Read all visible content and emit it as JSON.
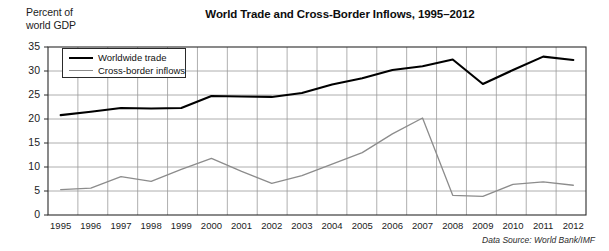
{
  "figure": {
    "title": "World Trade and Cross-Border Inflows, 1995–2012",
    "y_axis_caption": "Percent of\nworld GDP",
    "source_note": "Data Source: World Bank/IMF"
  },
  "legend": {
    "position": "top-left-inside",
    "entries": [
      {
        "label": "Worldwide trade",
        "color": "#000000",
        "style": "solid-thick"
      },
      {
        "label": "Cross-border inflows",
        "color": "#8c8c8c",
        "style": "solid-thin"
      }
    ]
  },
  "chart_data": {
    "type": "line",
    "title": "World Trade and Cross-Border Inflows, 1995–2012",
    "xlabel": "",
    "ylabel": "Percent of world GDP",
    "ylim": [
      0,
      35
    ],
    "yticks": [
      0,
      5,
      10,
      15,
      20,
      25,
      30,
      35
    ],
    "grid": true,
    "legend_position": "upper left",
    "categories": [
      "1995",
      "1996",
      "1997",
      "1998",
      "1999",
      "2000",
      "2001",
      "2002",
      "2003",
      "2004",
      "2005",
      "2006",
      "2007",
      "2008",
      "2009",
      "2010",
      "2011",
      "2012"
    ],
    "x": [
      1995,
      1996,
      1997,
      1998,
      1999,
      2000,
      2001,
      2002,
      2003,
      2004,
      2005,
      2006,
      2007,
      2008,
      2009,
      2010,
      2011,
      2012
    ],
    "series": [
      {
        "name": "Worldwide trade",
        "color": "#000000",
        "values": [
          20.8,
          21.5,
          22.3,
          22.2,
          22.3,
          24.8,
          24.7,
          24.6,
          25.4,
          27.2,
          28.5,
          30.2,
          31.0,
          32.4,
          27.3,
          30.2,
          33.0,
          32.3
        ]
      },
      {
        "name": "Cross-border inflows",
        "color": "#8c8c8c",
        "values": [
          5.3,
          5.6,
          8.0,
          7.0,
          9.5,
          11.8,
          9.1,
          6.6,
          8.2,
          10.6,
          13.0,
          16.9,
          20.2,
          4.1,
          3.9,
          6.4,
          6.9,
          6.2
        ]
      }
    ]
  }
}
